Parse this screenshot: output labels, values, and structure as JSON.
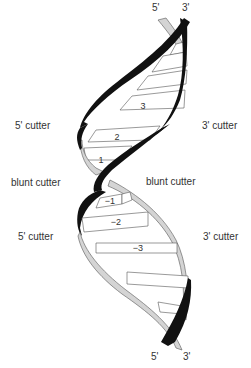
{
  "diagram": {
    "type": "dna-double-helix",
    "colors": {
      "strand_front": "#111111",
      "strand_back": "#d4d4d4",
      "strand_back_outline": "#555555",
      "base_fill": "#ffffff",
      "base_outline": "#555555",
      "text": "#333333"
    },
    "ends": {
      "top_5": "5'",
      "top_3": "3'",
      "bottom_5": "5'",
      "bottom_3": "3'"
    },
    "labels": {
      "left_upper": "5' cutter",
      "right_upper": "3' cutter",
      "left_middle": "blunt cutter",
      "right_middle": "blunt cutter",
      "left_lower": "5' cutter",
      "right_lower": "3' cutter"
    },
    "base_pair_numbers": [
      "3",
      "2",
      "1",
      "−1",
      "−2",
      "−3"
    ]
  }
}
